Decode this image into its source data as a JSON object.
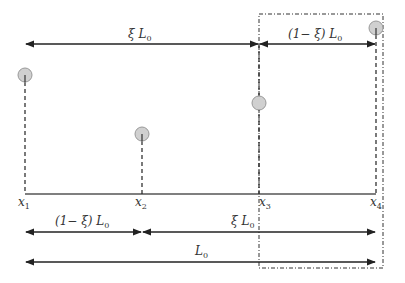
{
  "diagram": {
    "colors": {
      "line": "#222222",
      "node_fill": "#d0d0d0",
      "node_stroke": "#999999",
      "box": "#333333",
      "text": "#333333"
    },
    "axis": {
      "y": 194,
      "x_start": 25,
      "x_end": 376
    },
    "points": [
      {
        "id": "x1",
        "label": "x",
        "sub": "1",
        "x": 25,
        "node_y": 75
      },
      {
        "id": "x2",
        "label": "x",
        "sub": "2",
        "x": 142,
        "node_y": 134
      },
      {
        "id": "x3",
        "label": "x",
        "sub": "3",
        "x": 259,
        "node_y": 103
      },
      {
        "id": "x4",
        "label": "x",
        "sub": "4",
        "x": 376,
        "node_y": 28
      }
    ],
    "top_arrows": {
      "y": 44,
      "left": {
        "label_pre": "ξ L",
        "label_sub": "0",
        "from": 25,
        "to": 259
      },
      "right": {
        "label_pre": "(1− ξ) L",
        "label_sub": "0",
        "from": 259,
        "to": 376
      }
    },
    "bottom_arrows": {
      "row1": {
        "y": 232,
        "left": {
          "label_pre": "(1− ξ) L",
          "label_sub": "0",
          "from": 25,
          "to": 142
        },
        "right": {
          "label_pre": "ξ L",
          "label_sub": "0",
          "from": 142,
          "to": 376
        }
      },
      "row2": {
        "y": 262,
        "total": {
          "label_pre": "L",
          "label_sub": "0",
          "from": 25,
          "to": 376
        }
      }
    },
    "window_box": {
      "x": 259,
      "y": 14,
      "width": 124,
      "height": 254
    }
  }
}
